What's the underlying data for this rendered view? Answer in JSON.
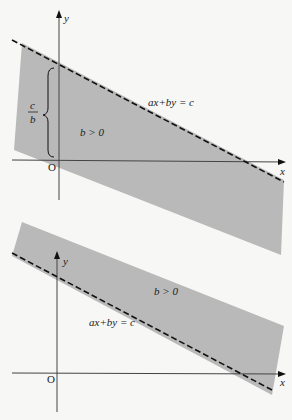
{
  "colors": {
    "background": "#f7f7f5",
    "shade": "#b9b9b9",
    "axis": "#444444",
    "dashed_line": "#111111",
    "text": "#222222"
  },
  "top_graph": {
    "y_axis_label": "y",
    "x_axis_label": "x",
    "origin_label": "O",
    "line_label": "ax+by = c",
    "region_label": "b > 0",
    "intercept_label_numerator": "c",
    "intercept_label_denominator": "b"
  },
  "bottom_graph": {
    "y_axis_label": "y",
    "x_axis_label": "x",
    "origin_label": "O",
    "line_label": "ax+by = c",
    "region_label": "b > 0"
  }
}
